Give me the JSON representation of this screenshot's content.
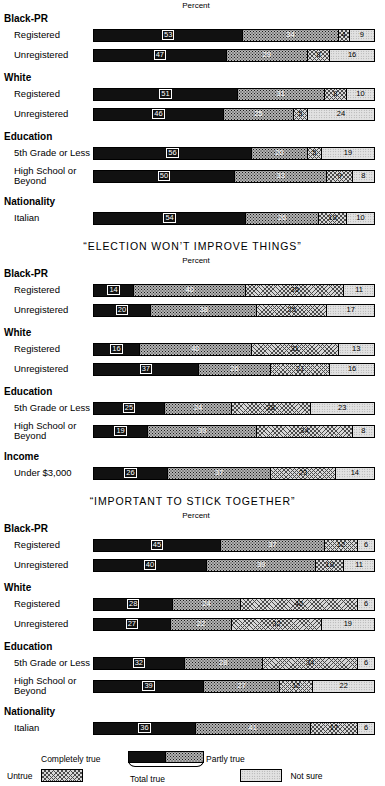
{
  "chart_data": {
    "type": "bar",
    "orientation": "horizontal-stacked",
    "xlabel": "Percent",
    "xlim": [
      0,
      100
    ],
    "grid": false,
    "legend_position": "bottom",
    "series": [
      {
        "name": "Completely true",
        "key": "completely_true"
      },
      {
        "name": "Partly true",
        "key": "partly_true"
      },
      {
        "name": "Untrue",
        "key": "untrue"
      },
      {
        "name": "Not sure",
        "key": "not_sure"
      }
    ],
    "annotations": [
      "Total true"
    ],
    "panels": [
      {
        "title": "",
        "axis_label": "Percent",
        "groups": [
          {
            "heading": "Black-PR",
            "rows": [
              {
                "label": "Registered",
                "values": [
                  53,
                  34,
                  4,
                  9
                ]
              },
              {
                "label": "Unregistered",
                "values": [
                  47,
                  29,
                  8,
                  16
                ]
              }
            ]
          },
          {
            "heading": "White",
            "rows": [
              {
                "label": "Registered",
                "values": [
                  51,
                  31,
                  8,
                  10
                ]
              },
              {
                "label": "Unregistered",
                "values": [
                  46,
                  25,
                  5,
                  24
                ]
              }
            ]
          },
          {
            "heading": "Education",
            "rows": [
              {
                "label": "5th Grade or Less",
                "values": [
                  56,
                  20,
                  5,
                  19
                ]
              },
              {
                "label": "High School or Beyond",
                "values": [
                  50,
                  33,
                  9,
                  8
                ]
              }
            ]
          },
          {
            "heading": "Nationality",
            "rows": [
              {
                "label": "Italian",
                "values": [
                  54,
                  26,
                  10,
                  10
                ]
              }
            ]
          }
        ]
      },
      {
        "title": "“ELECTION WON’T IMPROVE THINGS”",
        "axis_label": "Percent",
        "groups": [
          {
            "heading": "Black-PR",
            "rows": [
              {
                "label": "Registered",
                "values": [
                  14,
                  40,
                  35,
                  11
                ]
              },
              {
                "label": "Unregistered",
                "values": [
                  20,
                  38,
                  25,
                  17
                ]
              }
            ]
          },
          {
            "heading": "White",
            "rows": [
              {
                "label": "Registered",
                "values": [
                  16,
                  40,
                  31,
                  13
                ]
              },
              {
                "label": "Unregistered",
                "values": [
                  37,
                  26,
                  21,
                  16
                ]
              }
            ]
          },
          {
            "heading": "Education",
            "rows": [
              {
                "label": "5th Grade or Less",
                "values": [
                  25,
                  24,
                  28,
                  23
                ]
              },
              {
                "label": "High School or Beyond",
                "values": [
                  19,
                  39,
                  34,
                  8
                ]
              }
            ]
          },
          {
            "heading": "Income",
            "rows": [
              {
                "label": "Under $3,000",
                "values": [
                  26,
                  37,
                  23,
                  14
                ]
              }
            ]
          }
        ]
      },
      {
        "title": "“IMPORTANT TO STICK TOGETHER”",
        "axis_label": "Percent",
        "groups": [
          {
            "heading": "Black-PR",
            "rows": [
              {
                "label": "Registered",
                "values": [
                  45,
                  37,
                  12,
                  6
                ]
              },
              {
                "label": "Unregistered",
                "values": [
                  40,
                  39,
                  10,
                  11
                ]
              }
            ]
          },
          {
            "heading": "White",
            "rows": [
              {
                "label": "Registered",
                "values": [
                  28,
                  24,
                  42,
                  6
                ]
              },
              {
                "label": "Unregistered",
                "values": [
                  27,
                  22,
                  32,
                  19
                ]
              }
            ]
          },
          {
            "heading": "Education",
            "rows": [
              {
                "label": "5th Grade or Less",
                "values": [
                  32,
                  28,
                  34,
                  6
                ]
              },
              {
                "label": "High School or Beyond",
                "values": [
                  39,
                  27,
                  12,
                  22
                ]
              }
            ]
          },
          {
            "heading": "Nationality",
            "rows": [
              {
                "label": "Italian",
                "values": [
                  36,
                  41,
                  17,
                  6
                ]
              }
            ]
          }
        ]
      }
    ]
  },
  "legend": {
    "completely_true": "Completely true",
    "partly_true": "Partly true",
    "total_true": "Total true",
    "untrue": "Untrue",
    "not_sure": "Not sure"
  }
}
